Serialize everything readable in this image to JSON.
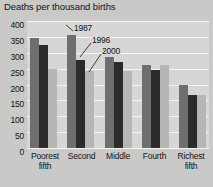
{
  "chart_data": {
    "type": "bar",
    "title": "Deaths per thousand births",
    "xlabel": "",
    "ylabel": "Deaths per thousand births",
    "ylim": [
      0,
      400
    ],
    "ytick_step": 50,
    "yticks": [
      "400",
      "350",
      "300",
      "250",
      "200",
      "150",
      "100",
      "50",
      "0"
    ],
    "grid": true,
    "legend_position": "annotated-on-bars",
    "categories": [
      "Poorest fifth",
      "Second",
      "Middle",
      "Fourth",
      "Richest fifth"
    ],
    "category_lines": [
      [
        "Poorest",
        "fifth"
      ],
      [
        "Second",
        ""
      ],
      [
        "Middle",
        ""
      ],
      [
        "Fourth",
        ""
      ],
      [
        "Richest",
        "fifth"
      ]
    ],
    "series": [
      {
        "name": "1987",
        "color": "#6e6e6e",
        "values": [
          345,
          355,
          287,
          260,
          198
        ]
      },
      {
        "name": "1996",
        "color": "#2b2b2b",
        "values": [
          325,
          278,
          272,
          247,
          166
        ]
      },
      {
        "name": "2000",
        "color": "#b6b6b4",
        "values": [
          248,
          243,
          243,
          263,
          168
        ]
      }
    ],
    "annotations": [
      {
        "text": "1987",
        "series": "1987"
      },
      {
        "text": "1996",
        "series": "1996"
      },
      {
        "text": "2000",
        "series": "2000"
      }
    ],
    "colors": {
      "background": "#c9c9c7",
      "plot_background": "#d6d6d4",
      "gridline": "#f4f4f2",
      "text": "#141414"
    }
  }
}
